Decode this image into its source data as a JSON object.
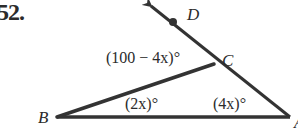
{
  "problem": {
    "number": "52."
  },
  "diagram": {
    "points": {
      "B": {
        "label": "B",
        "x": 57,
        "y": 117
      },
      "C": {
        "label": "C",
        "x": 214,
        "y": 64
      },
      "A": {
        "label": "A",
        "x": 290,
        "y": 117
      },
      "D": {
        "label": "D",
        "x": 173,
        "y": 20
      }
    },
    "angles": {
      "exterior_at_C": "(100 − 4x)°",
      "at_B": "(2x)°",
      "at_A": "(4x)°"
    },
    "colors": {
      "stroke": "#333333",
      "text": "#2b2b2b",
      "background": "#ffffff"
    }
  }
}
